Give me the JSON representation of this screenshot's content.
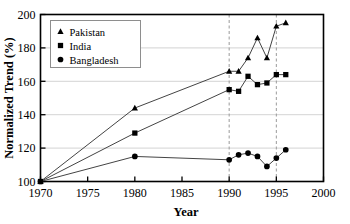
{
  "chart_data": {
    "type": "line",
    "title": "",
    "xlabel": "Year",
    "ylabel": "Normalized Trend (%)",
    "xlim": [
      1970,
      2000
    ],
    "ylim": [
      100,
      200
    ],
    "xticks": [
      1970,
      1975,
      1980,
      1985,
      1990,
      1995,
      2000
    ],
    "yticks": [
      100,
      120,
      140,
      160,
      180,
      200
    ],
    "grid": "horizontal",
    "legend_position": "top-left",
    "reference_lines": [
      {
        "orientation": "vertical",
        "x": 1990,
        "style": "dashed"
      },
      {
        "orientation": "vertical",
        "x": 1995,
        "style": "dashed"
      }
    ],
    "series": [
      {
        "name": "Pakistan",
        "marker": "triangle",
        "color": "#000000",
        "x": [
          1970,
          1980,
          1990,
          1991,
          1992,
          1993,
          1994,
          1995,
          1996
        ],
        "values": [
          100,
          144,
          166,
          166,
          174,
          186,
          174,
          193,
          195
        ]
      },
      {
        "name": "India",
        "marker": "square",
        "color": "#000000",
        "x": [
          1970,
          1980,
          1990,
          1991,
          1992,
          1993,
          1994,
          1995,
          1996
        ],
        "values": [
          100,
          129,
          155,
          154,
          163,
          158,
          159,
          164,
          164
        ]
      },
      {
        "name": "Bangladesh",
        "marker": "circle",
        "color": "#000000",
        "x": [
          1970,
          1980,
          1990,
          1991,
          1992,
          1993,
          1994,
          1995,
          1996
        ],
        "values": [
          100,
          115,
          113,
          116,
          117,
          115,
          109,
          114,
          119
        ]
      }
    ]
  },
  "legend": {
    "entries": [
      {
        "label": "Pakistan",
        "marker": "triangle"
      },
      {
        "label": "India",
        "marker": "square"
      },
      {
        "label": "Bangladesh",
        "marker": "circle"
      }
    ]
  },
  "axes": {
    "y_title": "Normalized Trend (%)",
    "x_title": "Year",
    "y_tick_labels": [
      "100",
      "120",
      "140",
      "160",
      "180",
      "200"
    ],
    "x_tick_labels": [
      "1970",
      "1975",
      "1980",
      "1985",
      "1990",
      "1995",
      "2000"
    ]
  },
  "colors": {
    "axis": "#000000",
    "grid": "#c8c8c8",
    "reference_line": "#9a9a9a",
    "marker": "#000000",
    "line": "#444444",
    "background": "#ffffff"
  }
}
